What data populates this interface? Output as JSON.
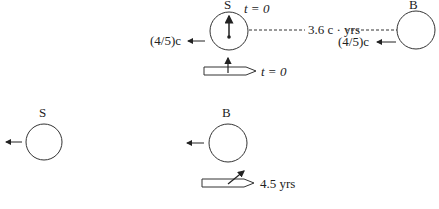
{
  "diagram": {
    "top_scene": {
      "ship_S": {
        "label": "S",
        "time_label": "t = 0",
        "velocity_label": "(4/5)c"
      },
      "ship_B": {
        "label": "B",
        "velocity_label": "(4/5)c"
      },
      "separation_label": "3.6 c · yrs",
      "rocket": {
        "time_label": "t = 0"
      }
    },
    "bottom_scene": {
      "ship_S": {
        "label": "S"
      },
      "ship_B": {
        "label": "B"
      },
      "rocket": {
        "time_label": "4.5 yrs"
      }
    },
    "colors": {
      "ink": "#333333",
      "background": "#ffffff"
    }
  }
}
